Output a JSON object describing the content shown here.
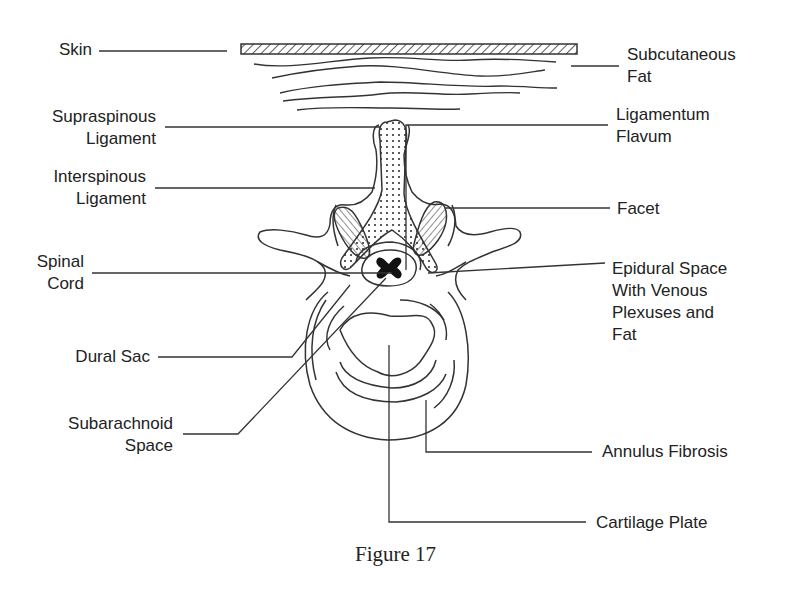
{
  "figure": {
    "caption": "Figure 17"
  },
  "labels": {
    "skin": "Skin",
    "subcutaneous_fat": "Subcutaneous\nFat",
    "supraspinous_ligament": "Supraspinous\nLigament",
    "ligamentum_flavum": "Ligamentum\nFlavum",
    "interspinous_ligament": "Interspinous\nLigament",
    "facet": "Facet",
    "spinal_cord": "Spinal\nCord",
    "epidural_space": "Epidural Space\nWith Venous\nPlexuses and\nFat",
    "dural_sac": "Dural Sac",
    "subarachnoid_space": "Subarachnoid\nSpace",
    "annulus_fibrosis": "Annulus Fibrosis",
    "cartilage_plate": "Cartilage Plate"
  },
  "colors": {
    "line": "#333333",
    "text": "#222222",
    "background": "#ffffff"
  }
}
